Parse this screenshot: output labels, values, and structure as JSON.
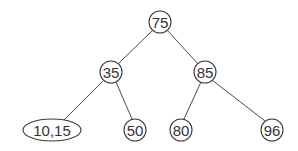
{
  "diagram": {
    "type": "binary-search-tree",
    "nodes": [
      {
        "id": "n75",
        "label": "75",
        "cx": 160,
        "cy": 22,
        "rx": 11,
        "ry": 11
      },
      {
        "id": "n35",
        "label": "35",
        "cx": 111,
        "cy": 72,
        "rx": 11,
        "ry": 11
      },
      {
        "id": "n85",
        "label": "85",
        "cx": 205,
        "cy": 72,
        "rx": 11,
        "ry": 11
      },
      {
        "id": "n1015",
        "label": "10,15",
        "cx": 52,
        "cy": 130,
        "rx": 29,
        "ry": 11
      },
      {
        "id": "n50",
        "label": "50",
        "cx": 135,
        "cy": 130,
        "rx": 11,
        "ry": 11
      },
      {
        "id": "n80",
        "label": "80",
        "cx": 181,
        "cy": 130,
        "rx": 11,
        "ry": 11
      },
      {
        "id": "n96",
        "label": "96",
        "cx": 272,
        "cy": 130,
        "rx": 11,
        "ry": 11
      }
    ],
    "edges": [
      {
        "from": "n75",
        "to": "n35"
      },
      {
        "from": "n75",
        "to": "n85"
      },
      {
        "from": "n35",
        "to": "n1015"
      },
      {
        "from": "n35",
        "to": "n50"
      },
      {
        "from": "n85",
        "to": "n80"
      },
      {
        "from": "n85",
        "to": "n96"
      }
    ]
  }
}
